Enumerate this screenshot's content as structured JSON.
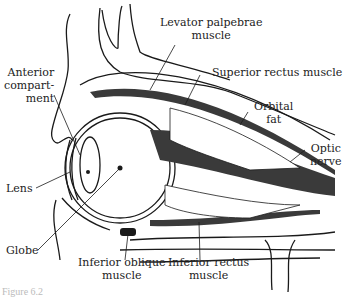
{
  "diagram": {
    "labels": {
      "levator": [
        "Levator palpebrae",
        "muscle"
      ],
      "anterior": [
        "Anterior",
        "compart-",
        "ment"
      ],
      "superior_rectus": "Superior rectus muscle",
      "orbital_fat": [
        "Orbital",
        "fat"
      ],
      "optic_nerve": [
        "Optic",
        "nerve"
      ],
      "lens": "Lens",
      "globe": "Globe",
      "inferior_oblique": [
        "Inferior oblique",
        "muscle"
      ],
      "inferior_rectus": [
        "Inferior rectus",
        "muscle"
      ]
    },
    "caption_fragment": "Figure 6.2",
    "colors": {
      "line": "#1a1a1a",
      "muscle": "#3a3a3a",
      "background": "#ffffff"
    }
  }
}
